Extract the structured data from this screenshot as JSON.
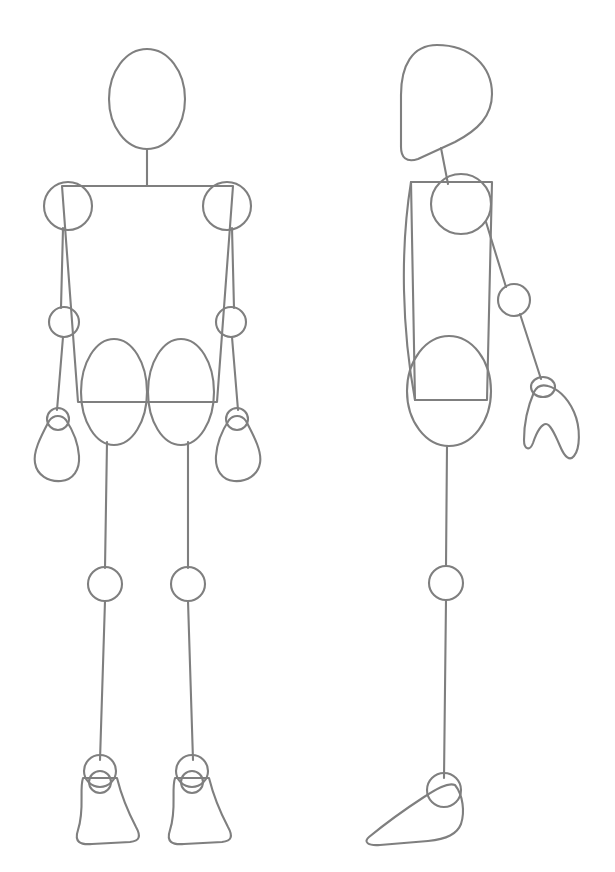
{
  "document": {
    "title": "Mannequin Figure Construction Reference",
    "subject": "simple-geometric-human-figure-drawing",
    "background_color": "#ffffff",
    "stroke_color": "#7f7f7f",
    "stroke_width": 2.1,
    "canvas": {
      "width": 615,
      "height": 872
    }
  },
  "figures": [
    {
      "id": "front-figure",
      "label": "Front View Mannequin",
      "view": "front",
      "parts": [
        {
          "name": "head",
          "shape": "ellipse",
          "cx": 147,
          "cy": 99,
          "rx": 38,
          "ry": 50
        },
        {
          "name": "neck",
          "shape": "line",
          "x1": 147,
          "y1": 149,
          "x2": 147,
          "y2": 185
        },
        {
          "name": "shoulder-left",
          "shape": "circle",
          "cx": 68,
          "cy": 206,
          "r": 24
        },
        {
          "name": "shoulder-right",
          "shape": "circle",
          "cx": 227,
          "cy": 206,
          "r": 24
        },
        {
          "name": "torso",
          "shape": "quad",
          "points": "62,185 233,185 218,400 76,400"
        },
        {
          "name": "upper-arm-left",
          "shape": "line",
          "x1": 63,
          "y1": 228,
          "x2": 62,
          "y2": 308
        },
        {
          "name": "upper-arm-right",
          "shape": "line",
          "x1": 232,
          "y1": 228,
          "x2": 233,
          "y2": 308
        },
        {
          "name": "elbow-left",
          "shape": "circle",
          "cx": 64,
          "cy": 322,
          "r": 15
        },
        {
          "name": "elbow-right",
          "shape": "circle",
          "cx": 231,
          "cy": 322,
          "r": 15
        },
        {
          "name": "forearm-left",
          "shape": "line",
          "x1": 64,
          "y1": 337,
          "x2": 58,
          "y2": 409
        },
        {
          "name": "forearm-right",
          "shape": "line",
          "x1": 231,
          "y1": 337,
          "x2": 237,
          "y2": 409
        },
        {
          "name": "wrist-left",
          "shape": "circle",
          "cx": 58,
          "cy": 419,
          "r": 11
        },
        {
          "name": "wrist-right",
          "shape": "circle",
          "cx": 237,
          "cy": 419,
          "r": 11
        },
        {
          "name": "hand-left",
          "shape": "mitten"
        },
        {
          "name": "hand-right",
          "shape": "mitten"
        },
        {
          "name": "hip-left",
          "shape": "ellipse",
          "cx": 115,
          "cy": 392,
          "rx": 33,
          "ry": 53
        },
        {
          "name": "hip-right",
          "shape": "ellipse",
          "cx": 181,
          "cy": 392,
          "rx": 33,
          "ry": 53
        },
        {
          "name": "thigh-left",
          "shape": "line",
          "x1": 107,
          "y1": 440,
          "x2": 105,
          "y2": 568
        },
        {
          "name": "thigh-right",
          "shape": "line",
          "x1": 188,
          "y1": 440,
          "x2": 187,
          "y2": 568
        },
        {
          "name": "knee-left",
          "shape": "circle",
          "cx": 105,
          "cy": 584,
          "r": 17
        },
        {
          "name": "knee-right",
          "shape": "circle",
          "cx": 187,
          "cy": 584,
          "r": 17
        },
        {
          "name": "shin-left",
          "shape": "line",
          "x1": 105,
          "y1": 601,
          "x2": 100,
          "y2": 760
        },
        {
          "name": "shin-right",
          "shape": "line",
          "x1": 187,
          "y1": 601,
          "x2": 192,
          "y2": 760
        },
        {
          "name": "ankle-left",
          "shape": "circle",
          "cx": 100,
          "cy": 771,
          "r": 16
        },
        {
          "name": "ankle-right",
          "shape": "circle",
          "cx": 192,
          "cy": 771,
          "r": 16
        },
        {
          "name": "heel-left",
          "shape": "circle",
          "cx": 100,
          "cy": 781,
          "r": 11
        },
        {
          "name": "heel-right",
          "shape": "circle",
          "cx": 192,
          "cy": 781,
          "r": 11
        },
        {
          "name": "foot-left",
          "shape": "trapezoid"
        },
        {
          "name": "foot-right",
          "shape": "trapezoid"
        }
      ]
    },
    {
      "id": "side-figure",
      "label": "Side View Mannequin",
      "view": "side",
      "parts": [
        {
          "name": "head",
          "shape": "teardrop",
          "cx": 442,
          "cy": 95
        },
        {
          "name": "neck",
          "shape": "line",
          "x1": 440,
          "y1": 145,
          "x2": 447,
          "y2": 182
        },
        {
          "name": "shoulder",
          "shape": "circle",
          "cx": 461,
          "cy": 204,
          "r": 30
        },
        {
          "name": "torso",
          "shape": "quad",
          "points": "411,182 492,182 488,398 414,398"
        },
        {
          "name": "upper-arm",
          "shape": "line",
          "x1": 486,
          "y1": 222,
          "x2": 505,
          "y2": 287
        },
        {
          "name": "elbow",
          "shape": "circle",
          "cx": 513,
          "cy": 300,
          "r": 16
        },
        {
          "name": "forearm",
          "shape": "line",
          "x1": 518,
          "y1": 314,
          "x2": 540,
          "y2": 378
        },
        {
          "name": "wrist",
          "shape": "circle",
          "cx": 543,
          "cy": 387,
          "r": 11
        },
        {
          "name": "hand",
          "shape": "claw"
        },
        {
          "name": "hip",
          "shape": "ellipse",
          "cx": 448,
          "cy": 391,
          "rx": 42,
          "ry": 55
        },
        {
          "name": "thigh",
          "shape": "line",
          "x1": 447,
          "y1": 446,
          "x2": 446,
          "y2": 566
        },
        {
          "name": "knee",
          "shape": "circle",
          "cx": 446,
          "cy": 583,
          "r": 17
        },
        {
          "name": "shin",
          "shape": "line",
          "x1": 446,
          "y1": 600,
          "x2": 444,
          "y2": 775
        },
        {
          "name": "ankle",
          "shape": "circle",
          "cx": 444,
          "cy": 790,
          "r": 17
        },
        {
          "name": "foot",
          "shape": "side-foot"
        }
      ]
    }
  ]
}
